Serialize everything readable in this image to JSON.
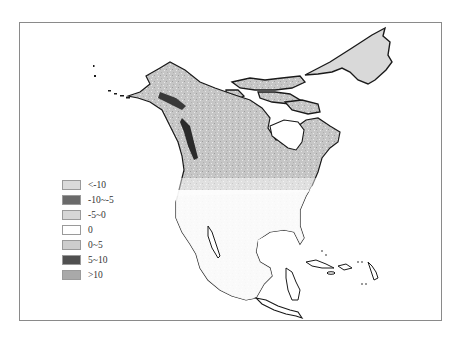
{
  "map": {
    "region": "North America",
    "frame_color": "#8a8a8a",
    "land_base_color": "#c9c9c9",
    "coastline_color": "#1a1a1a"
  },
  "legend": {
    "items": [
      {
        "label": "<-10",
        "color": "#dadada"
      },
      {
        "label": "-10~-5",
        "color": "#6a6a6a"
      },
      {
        "label": "-5~0",
        "color": "#d6d6d6"
      },
      {
        "label": "0",
        "color": "#ffffff"
      },
      {
        "label": "0~5",
        "color": "#cdcdcd"
      },
      {
        "label": "5~10",
        "color": "#505050"
      },
      {
        "label": ">10",
        "color": "#a9a9a9"
      }
    ]
  }
}
